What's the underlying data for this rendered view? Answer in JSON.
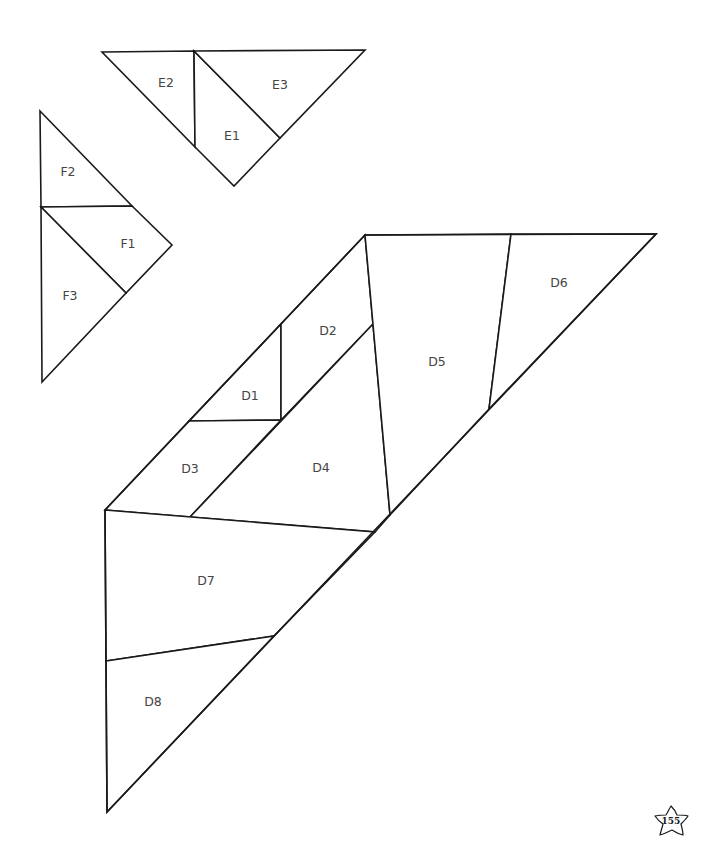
{
  "stroke_color": "#1a1a1a",
  "label_color": "#444444",
  "groups": {
    "E": {
      "pieces": [
        {
          "id": "E1",
          "label": "E1"
        },
        {
          "id": "E2",
          "label": "E2"
        },
        {
          "id": "E3",
          "label": "E3"
        }
      ]
    },
    "F": {
      "pieces": [
        {
          "id": "F1",
          "label": "F1"
        },
        {
          "id": "F2",
          "label": "F2"
        },
        {
          "id": "F3",
          "label": "F3"
        }
      ]
    },
    "D": {
      "pieces": [
        {
          "id": "D1",
          "label": "D1"
        },
        {
          "id": "D2",
          "label": "D2"
        },
        {
          "id": "D3",
          "label": "D3"
        },
        {
          "id": "D4",
          "label": "D4"
        },
        {
          "id": "D5",
          "label": "D5"
        },
        {
          "id": "D6",
          "label": "D6"
        },
        {
          "id": "D7",
          "label": "D7"
        },
        {
          "id": "D8",
          "label": "D8"
        }
      ]
    }
  },
  "page_number": {
    "icon": "star-icon",
    "value": "155"
  }
}
